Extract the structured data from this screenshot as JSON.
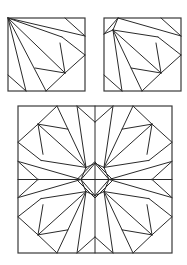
{
  "canvas": {
    "width": 187,
    "height": 265,
    "background": "#ffffff",
    "stroke": "#2a2a2a"
  },
  "panels": [
    {
      "name": "block-full-corner",
      "x": 8,
      "y": 18,
      "w": 77,
      "h": 73,
      "segments": [
        [
          57,
          0,
          77,
          18
        ],
        [
          0,
          0,
          77,
          18
        ],
        [
          0,
          0,
          54,
          19
        ],
        [
          54,
          19,
          77,
          37
        ],
        [
          52,
          25,
          57,
          55
        ],
        [
          0,
          0,
          57,
          55
        ],
        [
          57,
          55,
          77,
          37
        ],
        [
          0,
          0,
          38,
          73
        ],
        [
          0,
          0,
          18,
          73
        ],
        [
          27,
          50,
          57,
          55
        ],
        [
          0,
          57,
          18,
          73
        ],
        [
          57,
          55,
          38,
          73
        ]
      ]
    },
    {
      "name": "block-cut-corner",
      "x": 104,
      "y": 18,
      "w": 77,
      "h": 73,
      "segments": [
        [
          14,
          0,
          0,
          16
        ],
        [
          14,
          0,
          9,
          12
        ],
        [
          0,
          16,
          9,
          12
        ],
        [
          57,
          0,
          77,
          18
        ],
        [
          14,
          0,
          77,
          18
        ],
        [
          9,
          12,
          54,
          19
        ],
        [
          54,
          19,
          77,
          37
        ],
        [
          52,
          25,
          57,
          55
        ],
        [
          9,
          12,
          57,
          55
        ],
        [
          57,
          55,
          77,
          37
        ],
        [
          9,
          12,
          38,
          73
        ],
        [
          9,
          12,
          18,
          73
        ],
        [
          27,
          50,
          57,
          55
        ],
        [
          0,
          57,
          18,
          73
        ],
        [
          57,
          55,
          38,
          73
        ]
      ]
    }
  ],
  "big_block": {
    "name": "assembled-quilt-block",
    "x": 18,
    "y": 106,
    "w": 154,
    "h": 147,
    "center_diamond": {
      "cx": 77,
      "cy": 74,
      "r": 18
    }
  }
}
